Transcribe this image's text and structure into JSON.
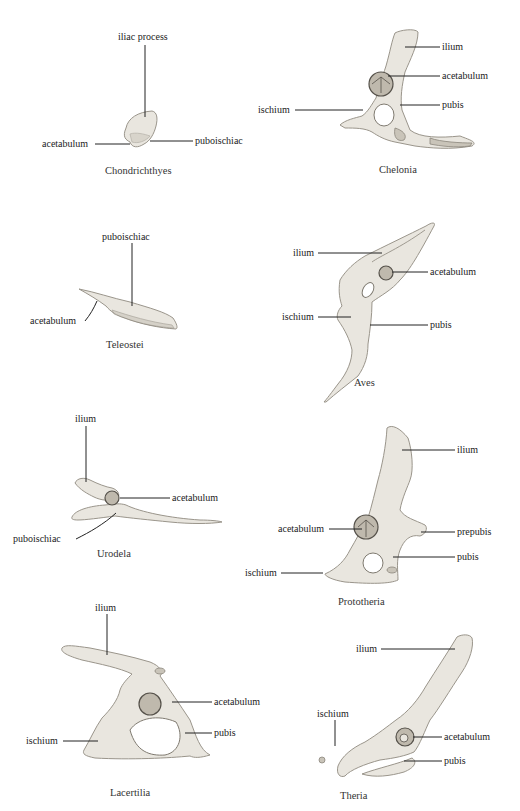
{
  "figure": {
    "panels": [
      {
        "taxon": "Chondrichthyes",
        "labels": [
          "iliac process",
          "acetabulum",
          "puboischiac"
        ]
      },
      {
        "taxon": "Chelonia",
        "labels": [
          "ilium",
          "acetabulum",
          "ischium",
          "pubis"
        ]
      },
      {
        "taxon": "Teleostei",
        "labels": [
          "puboischiac",
          "acetabulum"
        ]
      },
      {
        "taxon": "Aves",
        "labels": [
          "ilium",
          "acetabulum",
          "ischium",
          "pubis"
        ]
      },
      {
        "taxon": "Urodela",
        "labels": [
          "ilium",
          "acetabulum",
          "puboischiac"
        ]
      },
      {
        "taxon": "Prototheria",
        "labels": [
          "ilium",
          "acetabulum",
          "prepubis",
          "pubis",
          "ischium"
        ]
      },
      {
        "taxon": "Lacertilia",
        "labels": [
          "ilium",
          "acetabulum",
          "ischium",
          "pubis"
        ]
      },
      {
        "taxon": "Theria",
        "labels": [
          "ilium",
          "ischium",
          "acetabulum",
          "pubis"
        ]
      }
    ]
  }
}
